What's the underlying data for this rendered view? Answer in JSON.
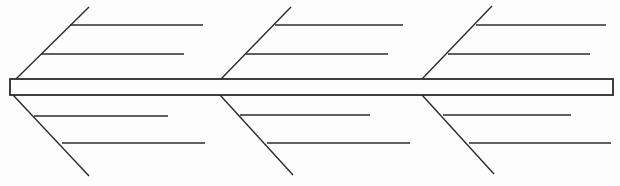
{
  "diagram": {
    "type": "fishbone-skeleton",
    "background_color": "#fdfdfd",
    "line_color": "#2b2b2b",
    "line_width": 1.4,
    "spine": {
      "shape": "rect",
      "x": 10,
      "y": 79,
      "width": 603,
      "height": 16,
      "fill": "#fdfdfd",
      "stroke_width": 1.8
    },
    "branches": [
      {
        "side": "top",
        "diagonal": {
          "x1": 16,
          "y1": 79,
          "x2": 89,
          "y2": 7
        },
        "sub_branches": [
          {
            "x1": 70,
            "y1": 25,
            "x2": 203,
            "y2": 25
          },
          {
            "x1": 41,
            "y1": 54,
            "x2": 184,
            "y2": 54
          }
        ]
      },
      {
        "side": "top",
        "diagonal": {
          "x1": 221,
          "y1": 79,
          "x2": 291,
          "y2": 7
        },
        "sub_branches": [
          {
            "x1": 275,
            "y1": 25,
            "x2": 403,
            "y2": 25
          },
          {
            "x1": 246,
            "y1": 54,
            "x2": 388,
            "y2": 54
          }
        ]
      },
      {
        "side": "top",
        "diagonal": {
          "x1": 422,
          "y1": 79,
          "x2": 492,
          "y2": 6
        },
        "sub_branches": [
          {
            "x1": 476,
            "y1": 25,
            "x2": 606,
            "y2": 25
          },
          {
            "x1": 448,
            "y1": 54,
            "x2": 590,
            "y2": 54
          }
        ]
      },
      {
        "side": "bottom",
        "diagonal": {
          "x1": 13,
          "y1": 95,
          "x2": 89,
          "y2": 176
        },
        "sub_branches": [
          {
            "x1": 34,
            "y1": 116,
            "x2": 168,
            "y2": 116
          },
          {
            "x1": 62,
            "y1": 143,
            "x2": 205,
            "y2": 143
          }
        ]
      },
      {
        "side": "bottom",
        "diagonal": {
          "x1": 220,
          "y1": 95,
          "x2": 293,
          "y2": 175
        },
        "sub_branches": [
          {
            "x1": 240,
            "y1": 115,
            "x2": 370,
            "y2": 115
          },
          {
            "x1": 267,
            "y1": 143,
            "x2": 410,
            "y2": 143
          }
        ]
      },
      {
        "side": "bottom",
        "diagonal": {
          "x1": 422,
          "y1": 95,
          "x2": 494,
          "y2": 174
        },
        "sub_branches": [
          {
            "x1": 443,
            "y1": 115,
            "x2": 571,
            "y2": 115
          },
          {
            "x1": 469,
            "y1": 143,
            "x2": 611,
            "y2": 143
          }
        ]
      }
    ]
  }
}
